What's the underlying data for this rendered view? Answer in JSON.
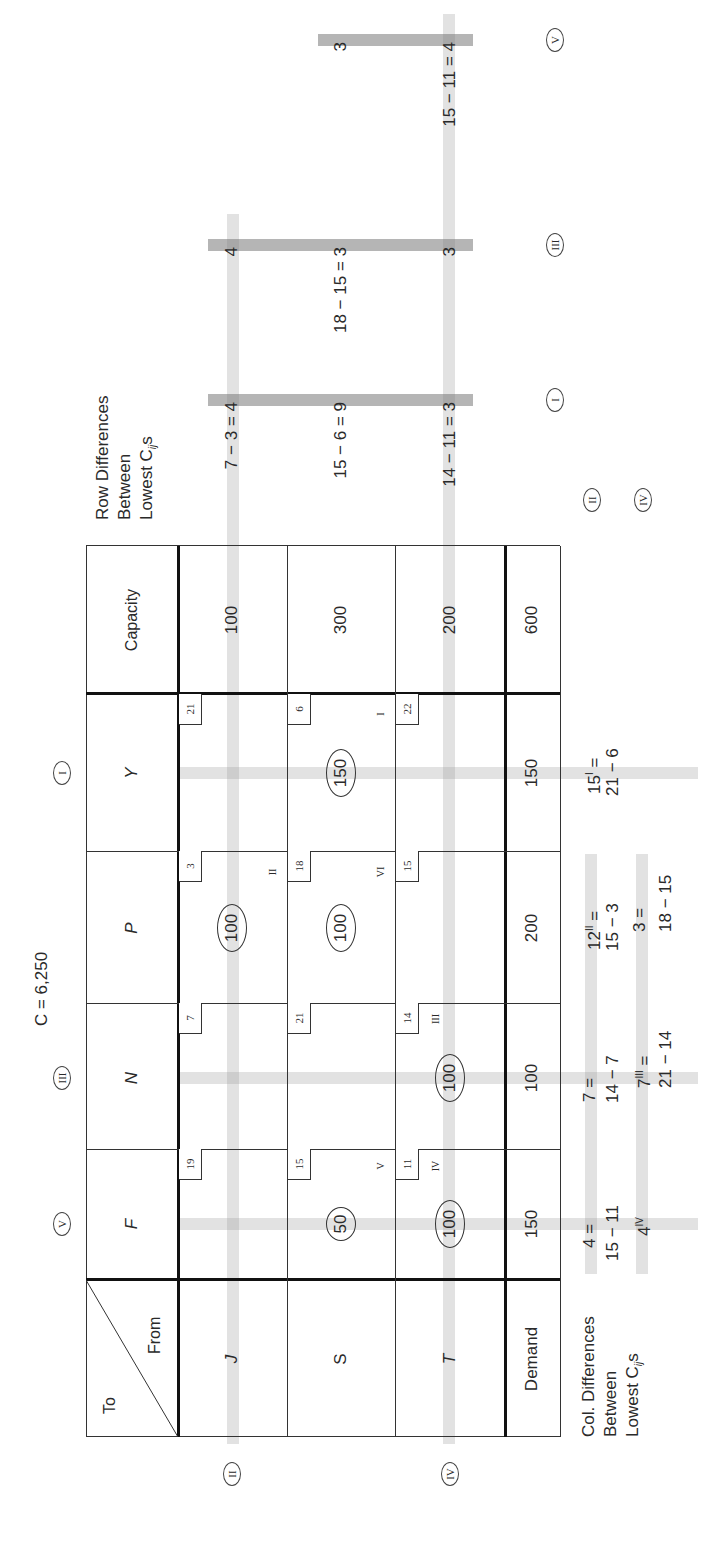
{
  "title": "C = 6,250",
  "corner": {
    "to": "To",
    "from": "From"
  },
  "columns": [
    {
      "label": "F",
      "demand": "150",
      "marker": "V"
    },
    {
      "label": "N",
      "demand": "100",
      "marker": "III"
    },
    {
      "label": "P",
      "demand": "200",
      "marker": ""
    },
    {
      "label": "Y",
      "demand": "150",
      "marker": "I"
    }
  ],
  "capacity_header": "Capacity",
  "demand_label": "Demand",
  "total": "600",
  "rows": [
    {
      "label": "J",
      "capacity": "100",
      "marker": "II",
      "cells": [
        {
          "cost": "19",
          "alloc": "",
          "step": ""
        },
        {
          "cost": "7",
          "alloc": "",
          "step": ""
        },
        {
          "cost": "3",
          "alloc": "100",
          "step": "II"
        },
        {
          "cost": "21",
          "alloc": "",
          "step": ""
        }
      ]
    },
    {
      "label": "S",
      "capacity": "300",
      "marker": "",
      "cells": [
        {
          "cost": "15",
          "alloc": "50",
          "step": "V"
        },
        {
          "cost": "21",
          "alloc": "",
          "step": ""
        },
        {
          "cost": "18",
          "alloc": "100",
          "step": "VI"
        },
        {
          "cost": "6",
          "alloc": "150",
          "step": "I"
        }
      ]
    },
    {
      "label": "T",
      "capacity": "200",
      "marker": "IV",
      "cells": [
        {
          "cost": "11",
          "alloc": "100",
          "step": "IV"
        },
        {
          "cost": "14",
          "alloc": "100",
          "step": "III"
        },
        {
          "cost": "15",
          "alloc": "",
          "step": ""
        },
        {
          "cost": "22",
          "alloc": "",
          "step": ""
        }
      ]
    }
  ],
  "row_differences": {
    "heading": [
      "Row Differences",
      "Between",
      "Lowest C",
      "ij",
      "s"
    ],
    "iterations": [
      {
        "marker": "I",
        "values": [
          "7 − 3 = 4",
          "15 − 6 = 9",
          "14 − 11 = 3"
        ]
      },
      {
        "marker": "III",
        "values": [
          "4",
          "18 − 15 = 3",
          "3"
        ]
      },
      {
        "marker": "V",
        "values": [
          "",
          "3",
          "15 − 11 = 4"
        ]
      }
    ]
  },
  "col_differences": {
    "heading": [
      "Col. Differences",
      "Between",
      "Lowest C",
      "ij",
      "s"
    ],
    "markers": [
      "II",
      "IV"
    ],
    "line1": [
      {
        "base": "4 =",
        "sup": ""
      },
      {
        "base": "7 =",
        "sup": ""
      },
      {
        "base": "12",
        "sup": "II",
        "after": " ="
      },
      {
        "base": "15",
        "sup": "I",
        "after": " ="
      }
    ],
    "line2": [
      "15 − 11",
      "14 − 7",
      "15 − 3",
      "21 − 6"
    ],
    "line3": [
      {
        "base": "4",
        "sup": "IV",
        "after": ""
      },
      {
        "base": "7",
        "sup": "III",
        "after": " ="
      },
      {
        "base": "3 =",
        "sup": "",
        "after": ""
      },
      {
        "base": "",
        "sup": "",
        "after": ""
      }
    ],
    "line4": [
      "",
      "21 − 14",
      "18 − 15",
      ""
    ]
  }
}
